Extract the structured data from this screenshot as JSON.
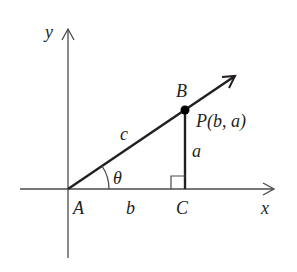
{
  "diagram": {
    "type": "right-triangle-on-coordinate-axes",
    "axes": {
      "x_label": "x",
      "y_label": "y"
    },
    "points": {
      "A": "A",
      "B": "B",
      "C": "C",
      "P": "P(b, a)"
    },
    "sides": {
      "hypotenuse": "c",
      "adjacent": "b",
      "opposite": "a"
    },
    "angle": "θ",
    "colors": {
      "line": "#231f20",
      "axis": "#4a4a4a",
      "background": "#ffffff"
    }
  }
}
